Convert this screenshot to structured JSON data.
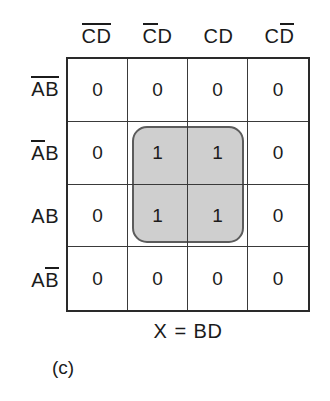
{
  "figure": {
    "label": "(c)",
    "equation": {
      "output": "X",
      "operator": "=",
      "expression": "BD",
      "full_text": "X = BD"
    }
  },
  "kmap": {
    "type": "karnaugh-map",
    "variables": [
      "A",
      "B",
      "C",
      "D"
    ],
    "row_variables": "AB",
    "column_variables": "CD",
    "column_headers": [
      {
        "text": "CD",
        "literals": [
          {
            "ch": "C",
            "bar": true
          },
          {
            "ch": "D",
            "bar": true
          }
        ]
      },
      {
        "text": "CD",
        "literals": [
          {
            "ch": "C",
            "bar": true
          },
          {
            "ch": "D",
            "bar": false
          }
        ]
      },
      {
        "text": "CD",
        "literals": [
          {
            "ch": "C",
            "bar": false
          },
          {
            "ch": "D",
            "bar": false
          }
        ]
      },
      {
        "text": "CD",
        "literals": [
          {
            "ch": "C",
            "bar": false
          },
          {
            "ch": "D",
            "bar": true
          }
        ]
      }
    ],
    "row_headers": [
      {
        "text": "AB",
        "literals": [
          {
            "ch": "A",
            "bar": true
          },
          {
            "ch": "B",
            "bar": true
          }
        ]
      },
      {
        "text": "AB",
        "literals": [
          {
            "ch": "A",
            "bar": true
          },
          {
            "ch": "B",
            "bar": false
          }
        ]
      },
      {
        "text": "AB",
        "literals": [
          {
            "ch": "A",
            "bar": false
          },
          {
            "ch": "B",
            "bar": false
          }
        ]
      },
      {
        "text": "AB",
        "literals": [
          {
            "ch": "A",
            "bar": false
          },
          {
            "ch": "B",
            "bar": true
          }
        ]
      }
    ],
    "cells": [
      [
        "0",
        "0",
        "0",
        "0"
      ],
      [
        "0",
        "1",
        "1",
        "0"
      ],
      [
        "0",
        "1",
        "1",
        "0"
      ],
      [
        "0",
        "0",
        "0",
        "0"
      ]
    ],
    "groups": [
      {
        "name": "BD",
        "row_start": 1,
        "row_end": 2,
        "col_start": 1,
        "col_end": 2,
        "fill_color": "#cfcfcf",
        "border_color": "#5c5c5c"
      }
    ]
  },
  "colors": {
    "background": "#ffffff",
    "text": "#1b1b1b",
    "grid_outer_border": "#2a2a2a",
    "grid_inner_line": "#3a3a3a",
    "group_fill": "#cfcfcf",
    "group_border": "#5c5c5c"
  }
}
